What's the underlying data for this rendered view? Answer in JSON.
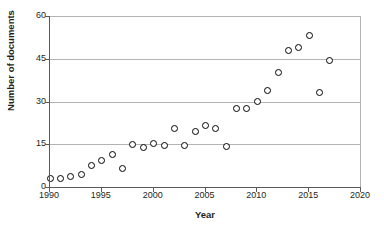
{
  "chart_data": {
    "type": "scatter",
    "title": "",
    "xlabel": "Year",
    "ylabel": "Number of documents",
    "xlim": [
      1990,
      2020
    ],
    "ylim": [
      0,
      60
    ],
    "xticks": [
      1990,
      1995,
      2000,
      2005,
      2010,
      2015,
      2020
    ],
    "yticks": [
      0,
      15,
      30,
      45,
      60
    ],
    "grid": "horizontal",
    "legend": "none",
    "marker": "open-circle",
    "marker_color": "#000000",
    "gridline_color": "#b3b3b3",
    "axis_color": "#58595b",
    "x": [
      1990,
      1991,
      1992,
      1993,
      1994,
      1995,
      1996,
      1997,
      1998,
      1999,
      2000,
      2001,
      2002,
      2003,
      2004,
      2005,
      2006,
      2007,
      2008,
      2009,
      2010,
      2011,
      2012,
      2013,
      2014,
      2015,
      2016,
      2017
    ],
    "values": [
      3.5,
      3.2,
      4.0,
      4.8,
      7.8,
      9.8,
      11.8,
      6.8,
      15.4,
      14.1,
      15.5,
      14.8,
      21.0,
      14.9,
      19.8,
      21.8,
      20.9,
      14.5,
      27.8,
      27.8,
      30.2,
      34.3,
      40.6,
      48.4,
      49.2,
      53.4,
      33.5,
      44.6
    ],
    "points": [
      {
        "year": 1990,
        "documents": 3.5
      },
      {
        "year": 1991,
        "documents": 3.2
      },
      {
        "year": 1992,
        "documents": 4.0
      },
      {
        "year": 1993,
        "documents": 4.8
      },
      {
        "year": 1994,
        "documents": 7.8
      },
      {
        "year": 1995,
        "documents": 9.8
      },
      {
        "year": 1996,
        "documents": 11.8
      },
      {
        "year": 1997,
        "documents": 6.8
      },
      {
        "year": 1998,
        "documents": 15.4
      },
      {
        "year": 1999,
        "documents": 14.1
      },
      {
        "year": 2000,
        "documents": 15.5
      },
      {
        "year": 2001,
        "documents": 14.8
      },
      {
        "year": 2002,
        "documents": 21.0
      },
      {
        "year": 2003,
        "documents": 14.9
      },
      {
        "year": 2004,
        "documents": 19.8
      },
      {
        "year": 2005,
        "documents": 21.8
      },
      {
        "year": 2006,
        "documents": 20.9
      },
      {
        "year": 2007,
        "documents": 14.5
      },
      {
        "year": 2008,
        "documents": 27.8
      },
      {
        "year": 2009,
        "documents": 27.8
      },
      {
        "year": 2010,
        "documents": 30.2
      },
      {
        "year": 2011,
        "documents": 34.3
      },
      {
        "year": 2012,
        "documents": 40.6
      },
      {
        "year": 2013,
        "documents": 48.4
      },
      {
        "year": 2014,
        "documents": 49.2
      },
      {
        "year": 2015,
        "documents": 53.4
      },
      {
        "year": 2016,
        "documents": 33.5
      },
      {
        "year": 2017,
        "documents": 44.6
      }
    ]
  }
}
